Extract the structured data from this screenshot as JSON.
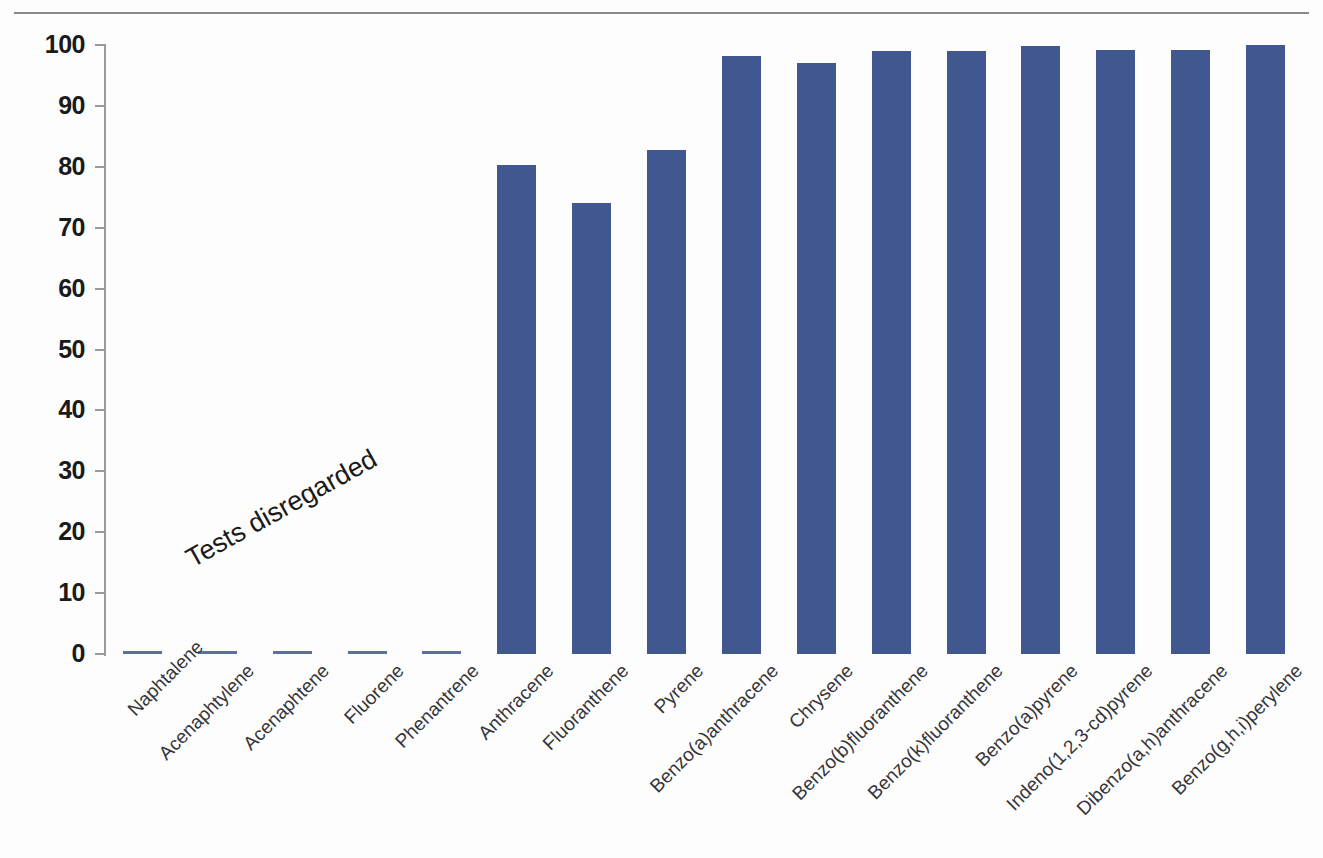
{
  "chart_data": {
    "type": "bar",
    "title": "",
    "xlabel": "",
    "ylabel": "",
    "ylim": [
      0,
      100
    ],
    "yticks": [
      0,
      10,
      20,
      30,
      40,
      50,
      60,
      70,
      80,
      90,
      100
    ],
    "grid": false,
    "legend": null,
    "bar_color": "#40578f",
    "categories": [
      "Naphtalene",
      "Acenaphtylene",
      "Acenaphtene",
      "Fluorene",
      "Phenantrene",
      "Anthracene",
      "Fluoranthene",
      "Pyrene",
      "Benzo(a)anthracene",
      "Chrysene",
      "Benzo(b)fluoranthene",
      "Benzo(k)fluoranthene",
      "Benzo(a)pyrene",
      "Indeno(1,2,3-cd)pyrene",
      "Dibenzo(a,h)anthracene",
      "Benzo(g,h,i)perylene"
    ],
    "values": [
      0,
      0,
      0,
      0,
      0,
      80.3,
      74.0,
      82.8,
      98.2,
      97.0,
      99.0,
      99.0,
      99.8,
      99.2,
      99.2,
      100.0
    ],
    "annotations": [
      {
        "text": "Tests disregarded",
        "rotation": -29,
        "applies_to": [
          "Naphtalene",
          "Acenaphtylene",
          "Acenaphtene",
          "Fluorene",
          "Phenantrene"
        ]
      }
    ]
  },
  "axes": {
    "y_tick_labels": [
      "100",
      "90",
      "80",
      "70",
      "60",
      "50",
      "40",
      "30",
      "20",
      "10",
      "0"
    ]
  }
}
